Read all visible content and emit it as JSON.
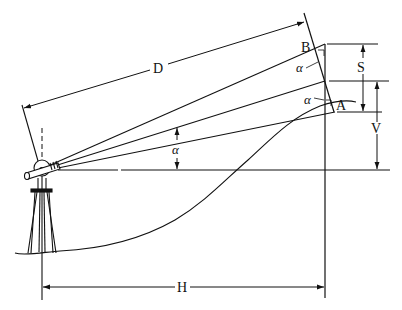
{
  "diagram": {
    "type": "stadia-inclined-sight",
    "labels": {
      "D": "D",
      "B": "B",
      "A": "A",
      "S": "S",
      "V": "V",
      "H": "H",
      "alpha_top": "α",
      "alpha_mid": "α",
      "alpha_instrument": "α"
    },
    "colors": {
      "ink": "#111111",
      "background": "#ffffff"
    }
  }
}
